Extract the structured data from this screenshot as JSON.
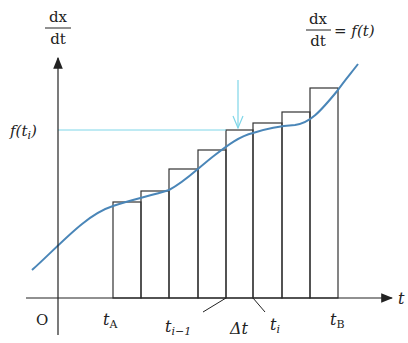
{
  "diagram": {
    "y_axis_label": {
      "numerator": "dx",
      "denominator": "dt"
    },
    "x_axis_label": "t",
    "origin_label": "O",
    "function_label": {
      "lhs_num": "dx",
      "lhs_den": "dt",
      "rhs": "= f(t)"
    },
    "level_label": "f(t",
    "level_label_sub": "i",
    "ticks": {
      "tA": {
        "base": "t",
        "sub": "A"
      },
      "tim1": {
        "base": "t",
        "sub": "i−1"
      },
      "delta": "Δt",
      "ti": {
        "base": "t",
        "sub": "i"
      },
      "tB": {
        "base": "t",
        "sub": "B"
      }
    },
    "colors": {
      "curve": "#4a86b8",
      "guide": "#7fd6e8",
      "axis": "#222222",
      "rect": "#333333"
    }
  }
}
